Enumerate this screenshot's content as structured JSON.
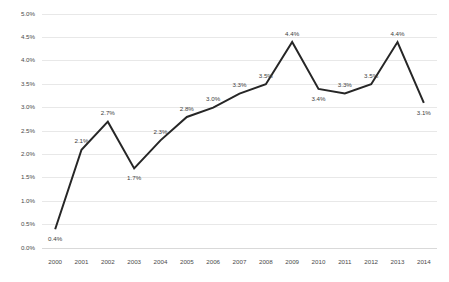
{
  "chart_data": {
    "type": "line",
    "title": "",
    "subtitle": "",
    "xlabel": "",
    "ylabel": "",
    "categories": [
      "2000",
      "2001",
      "2002",
      "2003",
      "2004",
      "2005",
      "2006",
      "2007",
      "2008",
      "2009",
      "2010",
      "2011",
      "2012",
      "2013",
      "2014"
    ],
    "values": [
      0.4,
      2.1,
      2.7,
      1.7,
      2.3,
      2.8,
      3.0,
      3.3,
      3.5,
      4.4,
      3.4,
      3.3,
      3.5,
      4.4,
      3.1
    ],
    "point_labels": [
      "0.4%",
      "2.1%",
      "2.7%",
      "1.7%",
      "2.3%",
      "2.8%",
      "3.0%",
      "3.3%",
      "3.5%",
      "4.4%",
      "3.4%",
      "3.3%",
      "3.5%",
      "4.4%",
      "3.1%"
    ],
    "label_positions": [
      "below",
      "above",
      "above",
      "below",
      "above",
      "above",
      "above",
      "above",
      "above",
      "above",
      "below",
      "above",
      "above",
      "above",
      "below"
    ],
    "ylim": [
      0.0,
      5.0
    ],
    "ytick_values": [
      0.0,
      0.5,
      1.0,
      1.5,
      2.0,
      2.5,
      3.0,
      3.5,
      4.0,
      4.5,
      5.0
    ],
    "ytick_labels": [
      "0.0%",
      "0.5%",
      "1.0%",
      "1.5%",
      "2.0%",
      "2.5%",
      "3.0%",
      "3.5%",
      "4.0%",
      "4.5%",
      "5.0%"
    ],
    "grid": true,
    "grid_axis": "y",
    "legend": false,
    "legend_position": "none",
    "markers": false,
    "series": [
      {
        "name": "",
        "color": "#262626",
        "values": [
          0.4,
          2.1,
          2.7,
          1.7,
          2.3,
          2.8,
          3.0,
          3.3,
          3.5,
          4.4,
          3.4,
          3.3,
          3.5,
          4.4,
          3.1
        ]
      }
    ]
  },
  "colors": {
    "line": "#262626",
    "grid": "#e8e8e8",
    "axis": "#d9d9d9",
    "tick_text": "#4a4a4a",
    "label_text": "#3d3d3d",
    "background": "#ffffff"
  }
}
